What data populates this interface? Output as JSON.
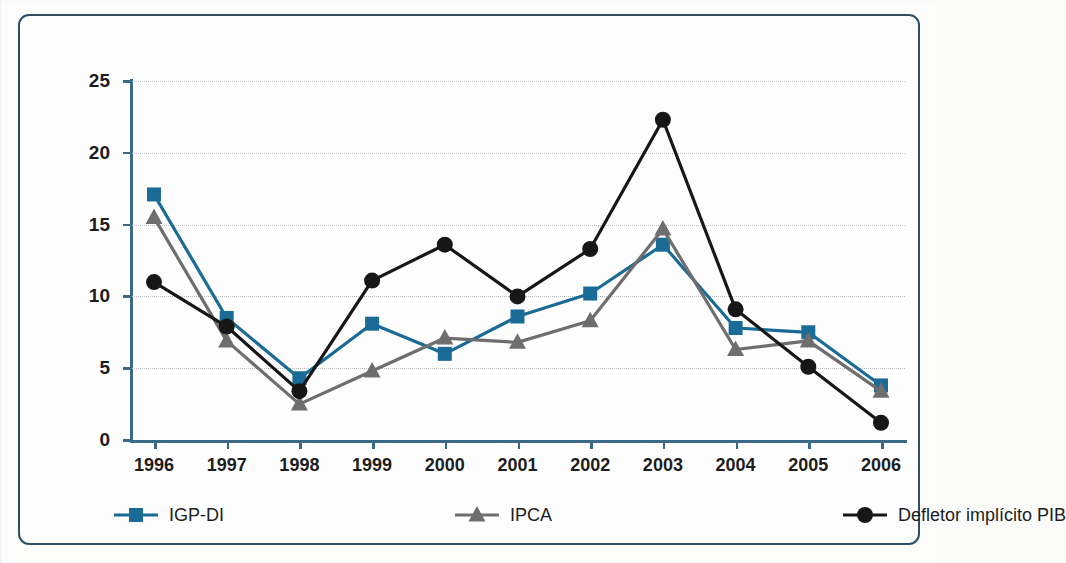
{
  "chart_data": {
    "type": "line",
    "title": "",
    "xlabel": "",
    "ylabel": "",
    "categories": [
      "1996",
      "1997",
      "1998",
      "1999",
      "2000",
      "2001",
      "2002",
      "2003",
      "2004",
      "2005",
      "2006"
    ],
    "x": [
      1996,
      1997,
      1998,
      1999,
      2000,
      2001,
      2002,
      2003,
      2004,
      2005,
      2006
    ],
    "ylim": [
      0,
      25
    ],
    "yticks": [
      0,
      5,
      10,
      15,
      20,
      25
    ],
    "grid": true,
    "legend_position": "bottom",
    "series": [
      {
        "name": "IGP-DI",
        "color": "#1a6b96",
        "marker": "square",
        "values": [
          17.1,
          8.5,
          4.3,
          8.1,
          6.0,
          8.6,
          10.2,
          13.6,
          7.8,
          7.5,
          3.8
        ]
      },
      {
        "name": "IPCA",
        "color": "#6e6e6e",
        "marker": "triangle",
        "values": [
          15.5,
          6.9,
          2.5,
          4.8,
          7.1,
          6.8,
          8.3,
          14.7,
          6.3,
          6.9,
          3.4
        ]
      },
      {
        "name": "Defletor implícito PIB",
        "color": "#171717",
        "marker": "circle",
        "values": [
          11.0,
          7.9,
          3.4,
          11.1,
          13.6,
          10.0,
          13.3,
          22.3,
          9.1,
          5.1,
          1.2
        ]
      }
    ]
  },
  "legend": {
    "items": [
      {
        "label": "IGP-DI"
      },
      {
        "label": "IPCA"
      },
      {
        "label": "Defletor implícito PIB"
      }
    ]
  },
  "style": {
    "frame_color": "#2d5068",
    "axis_color": "#3b6a87",
    "grid_color": "#b9bec4",
    "background": "#fdfdfd"
  }
}
